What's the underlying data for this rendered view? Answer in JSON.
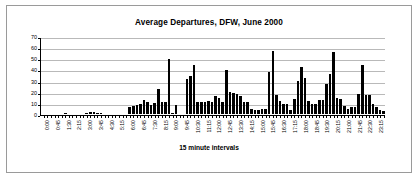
{
  "chart_data": {
    "type": "bar",
    "title": "Average Departures, DFW, June 2000",
    "xlabel": "15 minute intervals",
    "ylabel": "",
    "ylim": [
      0,
      70
    ],
    "yticks": [
      0,
      10,
      20,
      30,
      40,
      50,
      60,
      70
    ],
    "grid": true,
    "legend": false,
    "bar_color": "#000000",
    "tick_label_step": 3,
    "categories": [
      "0:00",
      "0:15",
      "0:30",
      "0:45",
      "1:00",
      "1:15",
      "1:30",
      "1:45",
      "2:00",
      "2:15",
      "2:30",
      "2:45",
      "3:00",
      "3:15",
      "3:30",
      "3:45",
      "4:00",
      "4:15",
      "4:30",
      "4:45",
      "5:00",
      "5:15",
      "5:30",
      "5:45",
      "6:00",
      "6:15",
      "6:30",
      "6:45",
      "7:00",
      "7:15",
      "7:30",
      "7:45",
      "8:00",
      "8:15",
      "8:30",
      "8:45",
      "9:00",
      "9:15",
      "9:30",
      "9:45",
      "10:00",
      "10:15",
      "10:30",
      "10:45",
      "11:00",
      "11:15",
      "11:30",
      "11:45",
      "12:00",
      "12:15",
      "12:30",
      "12:45",
      "13:00",
      "13:15",
      "13:30",
      "13:45",
      "14:00",
      "14:15",
      "14:30",
      "14:45",
      "15:00",
      "15:15",
      "15:30",
      "15:45",
      "16:00",
      "16:15",
      "16:30",
      "16:45",
      "17:00",
      "17:15",
      "17:30",
      "17:45",
      "18:00",
      "18:15",
      "18:30",
      "18:45",
      "19:00",
      "19:15",
      "19:30",
      "19:45",
      "20:00",
      "20:15",
      "20:30",
      "20:45",
      "21:00",
      "21:15",
      "21:30",
      "21:45",
      "22:00",
      "22:15",
      "22:30",
      "22:45",
      "23:00",
      "23:15",
      "23:30",
      "23:45"
    ],
    "tick_labels": [
      "0:00",
      "0:45",
      "1:30",
      "2:15",
      "3:00",
      "3:45",
      "4:30",
      "5:15",
      "6:00",
      "6:45",
      "7:30",
      "8:15",
      "9:00",
      "9:45",
      "10:30",
      "11:15",
      "12:00",
      "12:45",
      "13:30",
      "14:15",
      "15:00",
      "15:45",
      "16:30",
      "17:15",
      "18:00",
      "18:45",
      "19:30",
      "20:15",
      "21:00",
      "21:45",
      "22:30",
      "23:15"
    ],
    "values": [
      0,
      0,
      0,
      0,
      0,
      0,
      1,
      0,
      0,
      0,
      0,
      0,
      1,
      2,
      2,
      1,
      1,
      0,
      0,
      0,
      0,
      0,
      0,
      0,
      6,
      7,
      8,
      9,
      13,
      11,
      8,
      10,
      23,
      11,
      11,
      50,
      1,
      8,
      0,
      0,
      32,
      35,
      45,
      11,
      11,
      11,
      12,
      11,
      16,
      15,
      11,
      40,
      20,
      19,
      18,
      16,
      11,
      11,
      5,
      4,
      4,
      5,
      5,
      38,
      57,
      17,
      12,
      9,
      9,
      4,
      14,
      30,
      43,
      33,
      12,
      9,
      9,
      13,
      13,
      27,
      36,
      56,
      15,
      14,
      7,
      5,
      6,
      6,
      18,
      45,
      17,
      17,
      9,
      6,
      4,
      3
    ],
    "values_extended_note": ""
  },
  "values_full": [
    0,
    0,
    0,
    0,
    0,
    0,
    1,
    0,
    0,
    0,
    0,
    0,
    1,
    2,
    2,
    1,
    1,
    0,
    0,
    0,
    0,
    0,
    0,
    0,
    6,
    7,
    8,
    9,
    13,
    11,
    8,
    10,
    23,
    11,
    11,
    50,
    1,
    8,
    0,
    0,
    32,
    35,
    45,
    11,
    11,
    11,
    12,
    11,
    16,
    15,
    11,
    40,
    20,
    19,
    18,
    16,
    11,
    11,
    5,
    4,
    4,
    5,
    5,
    38,
    57,
    17,
    12,
    9,
    9,
    4,
    14,
    30,
    43,
    33,
    12,
    9,
    9,
    13,
    13,
    27,
    36,
    56,
    15,
    14,
    7,
    5,
    6,
    6,
    18,
    45,
    17,
    17,
    9,
    6,
    4,
    3
  ]
}
